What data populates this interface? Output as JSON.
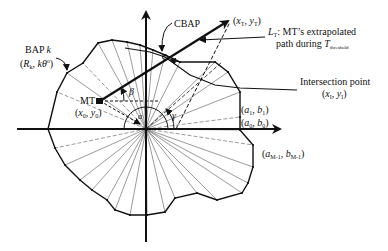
{
  "diagram": {
    "center": [
      146,
      129
    ],
    "axes": {
      "x_axis": {
        "from": [
          17,
          129
        ],
        "to": [
          285,
          129
        ]
      },
      "y_axis": {
        "from": [
          146,
          242
        ],
        "to": [
          146,
          8
        ]
      }
    },
    "outline_vertices": [
      [
        48,
        129
      ],
      [
        55,
        148
      ],
      [
        65,
        165
      ],
      [
        80,
        180
      ],
      [
        92,
        190
      ],
      [
        107,
        200
      ],
      [
        115,
        210
      ],
      [
        130,
        215
      ],
      [
        147,
        215
      ],
      [
        165,
        212
      ],
      [
        175,
        198
      ],
      [
        197,
        193
      ],
      [
        217,
        200
      ],
      [
        242,
        193
      ],
      [
        248,
        183
      ],
      [
        253,
        167
      ],
      [
        253,
        145
      ],
      [
        240,
        130
      ],
      [
        240,
        117
      ],
      [
        240,
        92
      ],
      [
        228,
        72
      ],
      [
        215,
        62
      ],
      [
        180,
        62
      ],
      [
        165,
        55
      ],
      [
        153,
        50
      ],
      [
        140,
        45
      ],
      [
        127,
        42
      ],
      [
        112,
        40
      ],
      [
        98,
        43
      ],
      [
        83,
        63
      ],
      [
        67,
        73
      ],
      [
        57,
        92
      ]
    ],
    "dashed_spoke_indices": [
      1,
      16,
      18,
      29,
      31
    ],
    "mt_point": [
      100,
      101
    ],
    "target_point": [
      233,
      18
    ],
    "cbap_point": [
      165,
      57
    ],
    "intersection_curve": [
      [
        125,
        48
      ],
      [
        150,
        52
      ],
      [
        165,
        57
      ],
      [
        190,
        75
      ],
      [
        215,
        85
      ],
      [
        240,
        88
      ],
      [
        297,
        90
      ]
    ],
    "colors": {
      "stroke": "#111111",
      "background": "#ffffff",
      "thin_stroke": "#555555"
    }
  },
  "labels": {
    "cbap": "CBAP",
    "target": {
      "prefix": "(",
      "x": "x",
      "xsub": "T",
      "sep": ", ",
      "y": "y",
      "ysub": "T",
      "suffix": ")"
    },
    "lt_title": {
      "sym": "L",
      "sub": "T",
      "text": ": MT’s extrapolated"
    },
    "lt_line2": {
      "text": "path during ",
      "sym": "T",
      "sub": "threshold"
    },
    "bap_k_line1": {
      "text": "BAP ",
      "sym": "k"
    },
    "bap_k_line2": {
      "prefix": "(",
      "r": "R",
      "rsub": "k",
      "sep": ", ",
      "ktheta": "kθ",
      "sup": "o",
      "suffix": ")"
    },
    "mt": "MT",
    "mt_coords": {
      "prefix": "(",
      "x": "x",
      "xsub": "0",
      "sep": ", ",
      "y": "y",
      "ysub": "0",
      "suffix": ")"
    },
    "beta": "β",
    "alpha": "α",
    "gamma": "γ",
    "intersection_title": "Intersection point",
    "intersection_coords": {
      "prefix": "(",
      "x": "x",
      "xsub": "I",
      "sep": ", ",
      "y": "y",
      "ysub": "I",
      "suffix": ")"
    },
    "a1b1": {
      "prefix": "(",
      "a": "a",
      "asub": "1",
      "sep": ", ",
      "b": "b",
      "bsub": "1",
      "suffix": ")"
    },
    "a0b0": {
      "prefix": "(",
      "a": "a",
      "asub": "0",
      "sep": ", ",
      "b": "b",
      "bsub": "0",
      "suffix": ")"
    },
    "am1bm1": {
      "prefix": "(",
      "a": "a",
      "asub": "M-1",
      "sep": ", ",
      "b": "b",
      "bsub": "M-1",
      "suffix": ")"
    }
  }
}
